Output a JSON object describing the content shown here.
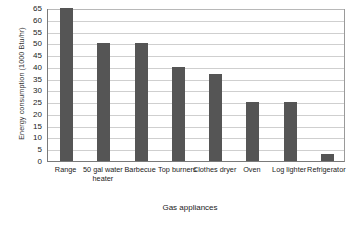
{
  "chart_data": {
    "type": "bar",
    "title": "",
    "xlabel": "Gas appliances",
    "ylabel": "Energy consumption (1000 Btu/hr)",
    "categories": [
      "Range",
      "50 gal water heater",
      "Barbecue",
      "Top burners",
      "Clothes dryer",
      "Oven",
      "Log lighter",
      "Refrigerator"
    ],
    "values": [
      65,
      50,
      50,
      40,
      37,
      25,
      25,
      3
    ],
    "ylim": [
      0,
      65
    ],
    "ytick_step": 5,
    "yticks": [
      0,
      5,
      10,
      15,
      20,
      25,
      30,
      35,
      40,
      45,
      50,
      55,
      60,
      65
    ],
    "ytick_labels": [
      "0",
      "5",
      "10",
      "15",
      "20",
      "25",
      "30",
      "35",
      "40",
      "45",
      "50",
      "55",
      "60",
      "65"
    ],
    "grid": "horizontal",
    "legend": "none",
    "bar_color": "#555555",
    "gridline_color": "#cfcfcf",
    "axis_color": "#7a7a7a",
    "background_color": "#ffffff"
  }
}
